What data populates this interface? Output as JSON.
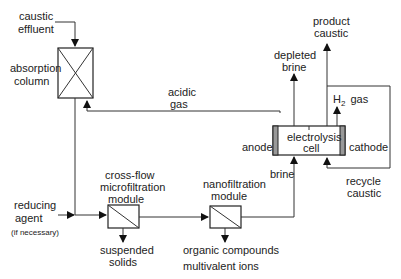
{
  "diagram": {
    "type": "process-flow",
    "units": {
      "absorption_column": {
        "line1": "absorption",
        "line2": "column"
      },
      "microfiltration": {
        "line1": "cross-flow",
        "line2": "microfiltration",
        "line3": "module"
      },
      "nanofiltration": {
        "line1": "nanofiltration",
        "line2": "module"
      },
      "electrolysis_cell": {
        "line1": "electrolysis",
        "line2": "cell",
        "anode": "anode",
        "cathode": "cathode"
      }
    },
    "streams": {
      "caustic_effluent": {
        "line1": "caustic",
        "line2": "effluent"
      },
      "acidic_gas": {
        "line1": "acidic",
        "line2": "gas"
      },
      "reducing_agent": {
        "line1": "reducing",
        "line2": "agent",
        "note": "(if necessary)"
      },
      "suspended_solids": {
        "line1": "suspended",
        "line2": "solids"
      },
      "organic_compounds": {
        "line1": "organic compounds",
        "line2": "multivalent ions"
      },
      "brine": "brine",
      "depleted_brine": {
        "line1": "depleted",
        "line2": "brine"
      },
      "product_caustic": {
        "line1": "product",
        "line2": "caustic"
      },
      "h2_gas": {
        "h": "H",
        "sub": "2",
        "gas": "gas"
      },
      "recycle_caustic": {
        "line1": "recycle",
        "line2": "caustic"
      }
    }
  }
}
